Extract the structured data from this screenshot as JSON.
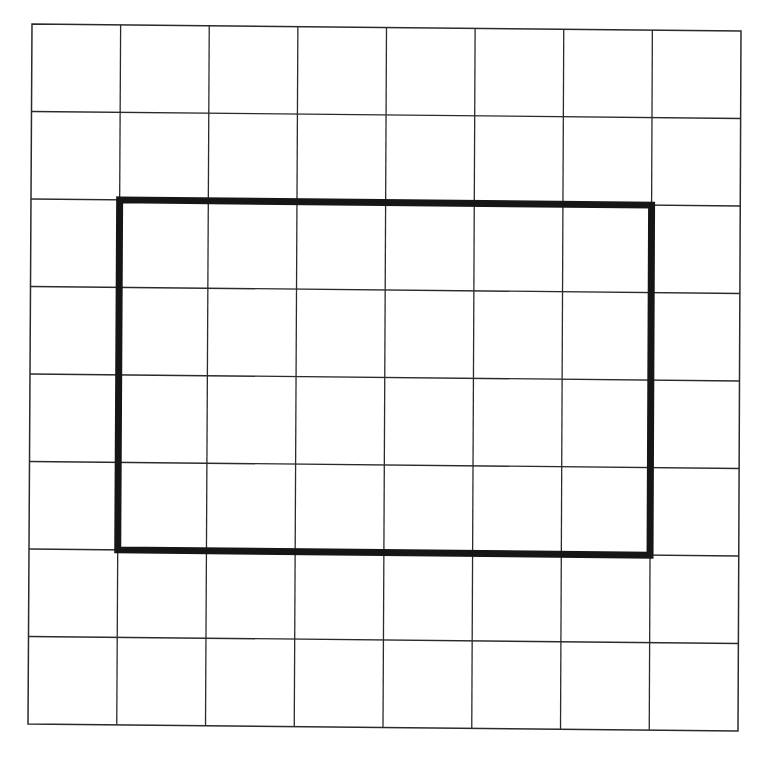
{
  "diagram": {
    "type": "grid-with-rectangle",
    "grid": {
      "columns": 8,
      "rows": 8,
      "corners": {
        "top_left": [
          32,
          24
        ],
        "top_right": [
          741,
          31
        ],
        "bottom_left": [
          28,
          724
        ],
        "bottom_right": [
          738,
          731
        ]
      },
      "line_color": "#2a2a2a"
    },
    "rectangle": {
      "col_start": 1,
      "col_end": 7,
      "row_start": 2,
      "row_end": 6,
      "width_cells": 6,
      "height_cells": 4,
      "stroke_color": "#161616",
      "stroke_width": 7
    },
    "background_color": "#ffffff"
  }
}
